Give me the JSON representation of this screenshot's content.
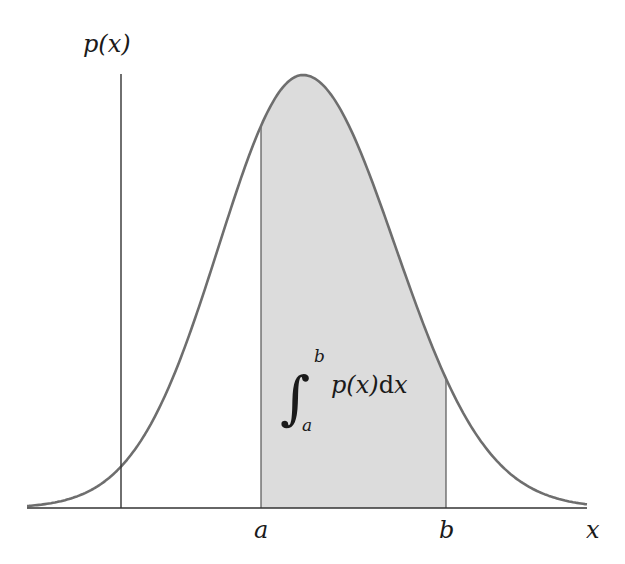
{
  "figure": {
    "y_axis_label": "p(x)",
    "x_axis_label": "x",
    "lower_bound_label": "a",
    "upper_bound_label": "b",
    "integral": {
      "upper_limit": "b",
      "lower_limit": "a",
      "integrand": "p(x)",
      "differential": "dx",
      "integrand_prefix": "p(",
      "integrand_var": "x",
      "integrand_suffix": ")",
      "d": "d",
      "d_var": "x"
    },
    "colors": {
      "curve": "#6e6e6e",
      "shading": "#dcdcdc",
      "axis": "#333333",
      "background": "#ffffff"
    }
  },
  "chart_data": {
    "type": "area",
    "title": "",
    "xlabel": "x",
    "ylabel": "p(x)",
    "curve": "gaussian-like density",
    "shaded_interval": [
      "a",
      "b"
    ],
    "annotation": "∫_a^b p(x) dx",
    "x_tick_labels": [
      "a",
      "b"
    ],
    "grid": false,
    "legend": null
  }
}
